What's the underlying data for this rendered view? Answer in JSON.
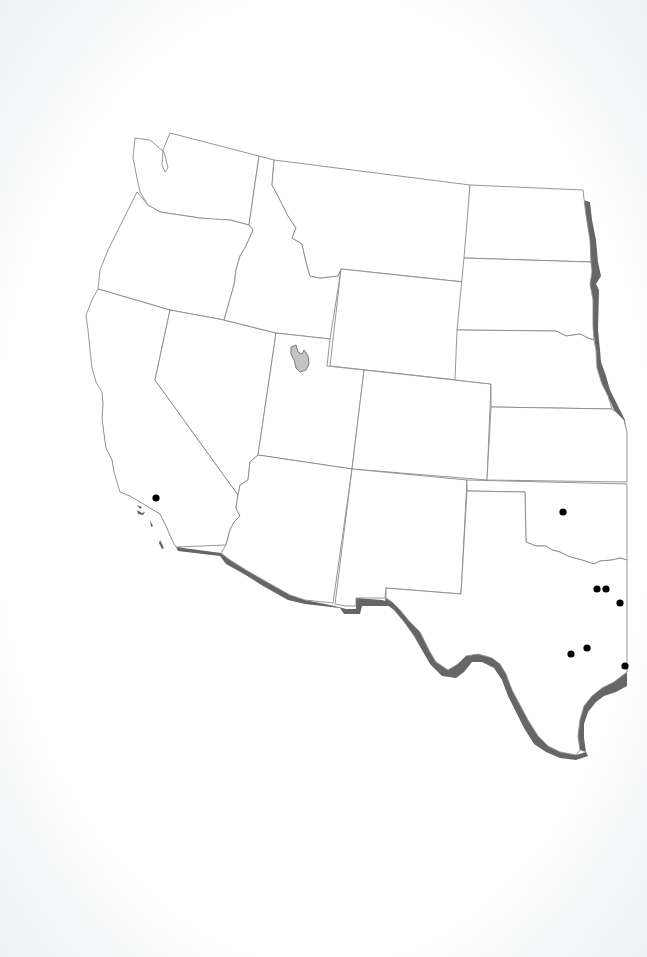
{
  "map": {
    "title": "",
    "region": "Western United States",
    "colors": {
      "background": "#ffffff",
      "state_fill": "#ffffff",
      "state_stroke": "#8a8a8a",
      "range_band": "#666666",
      "lake_fill": "#c4c4c4",
      "dot": "#000000"
    },
    "states": [
      {
        "id": "washington",
        "name": "Washington"
      },
      {
        "id": "oregon",
        "name": "Oregon"
      },
      {
        "id": "california",
        "name": "California"
      },
      {
        "id": "idaho",
        "name": "Idaho"
      },
      {
        "id": "nevada",
        "name": "Nevada"
      },
      {
        "id": "montana",
        "name": "Montana"
      },
      {
        "id": "wyoming",
        "name": "Wyoming"
      },
      {
        "id": "utah",
        "name": "Utah"
      },
      {
        "id": "arizona",
        "name": "Arizona"
      },
      {
        "id": "colorado",
        "name": "Colorado"
      },
      {
        "id": "new-mexico",
        "name": "New Mexico"
      },
      {
        "id": "north-dakota",
        "name": "North Dakota"
      },
      {
        "id": "south-dakota",
        "name": "South Dakota"
      },
      {
        "id": "nebraska",
        "name": "Nebraska"
      },
      {
        "id": "kansas",
        "name": "Kansas"
      },
      {
        "id": "oklahoma",
        "name": "Oklahoma"
      },
      {
        "id": "texas",
        "name": "Texas"
      }
    ],
    "features": {
      "lake": {
        "id": "great-salt-lake",
        "name": "Great Salt Lake"
      },
      "range_band_segments": [
        "eastern border (Minnesota/Iowa/Missouri side)",
        "California coast",
        "US-Mexico border",
        "Texas Gulf coast"
      ]
    },
    "points": [
      {
        "x": 156,
        "y": 498,
        "state": "California"
      },
      {
        "x": 563,
        "y": 512,
        "state": "Oklahoma"
      },
      {
        "x": 597,
        "y": 589,
        "state": "Texas"
      },
      {
        "x": 606,
        "y": 589,
        "state": "Texas"
      },
      {
        "x": 620,
        "y": 603,
        "state": "Texas"
      },
      {
        "x": 571,
        "y": 654,
        "state": "Texas"
      },
      {
        "x": 587,
        "y": 648,
        "state": "Texas"
      },
      {
        "x": 625,
        "y": 666,
        "state": "Texas"
      }
    ]
  }
}
